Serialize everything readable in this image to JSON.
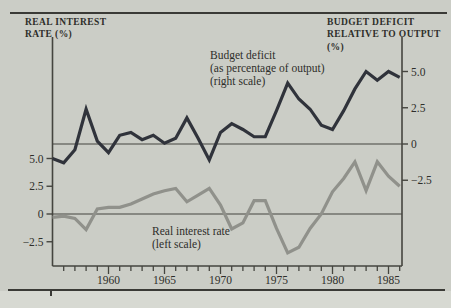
{
  "chart_data": {
    "type": "line",
    "title": "",
    "x": [
      1955,
      1956,
      1957,
      1958,
      1959,
      1960,
      1961,
      1962,
      1963,
      1964,
      1965,
      1966,
      1967,
      1968,
      1969,
      1970,
      1971,
      1972,
      1973,
      1974,
      1975,
      1976,
      1977,
      1978,
      1979,
      1980,
      1981,
      1982,
      1983,
      1984,
      1985,
      1986
    ],
    "series": [
      {
        "name": "Budget deficit (as percentage of output)",
        "scale": "right",
        "color": "#30333b",
        "values": [
          -1.0,
          -1.3,
          -0.4,
          2.4,
          0.2,
          -0.6,
          0.6,
          0.8,
          0.3,
          0.6,
          0.05,
          0.4,
          1.8,
          0.4,
          -1.1,
          0.8,
          1.4,
          1.0,
          0.5,
          0.5,
          2.3,
          4.2,
          3.1,
          2.4,
          1.3,
          1.0,
          2.3,
          3.8,
          5.0,
          4.4,
          5.0,
          4.6
        ]
      },
      {
        "name": "Real interest rate",
        "scale": "left",
        "color": "#90918b",
        "values": [
          -0.3,
          -0.2,
          -0.4,
          -1.4,
          0.45,
          0.6,
          0.6,
          0.9,
          1.35,
          1.8,
          2.1,
          2.3,
          1.1,
          1.7,
          2.3,
          0.8,
          -1.35,
          -0.8,
          1.2,
          1.2,
          -1.3,
          -3.5,
          -3.0,
          -1.3,
          0.0,
          2.0,
          3.2,
          4.7,
          2.1,
          4.7,
          3.4,
          2.5
        ]
      }
    ],
    "left_axis": {
      "header": "REAL INTEREST\nRATE (%)",
      "ticks": [
        5.0,
        2.5,
        0,
        -2.5
      ],
      "tick_labels": [
        "5.0",
        "2.5",
        "0",
        "−2.5"
      ]
    },
    "right_axis": {
      "header": "BUDGET DEFICIT\nRELATIVE TO OUTPUT (%)",
      "ticks": [
        5.0,
        2.5,
        0,
        -2.5
      ],
      "tick_labels": [
        "5.0",
        "2.5",
        "0",
        "−2.5"
      ]
    },
    "x_axis": {
      "major_ticks": [
        1960,
        1965,
        1970,
        1975,
        1980,
        1985
      ],
      "major_tick_labels": [
        "1960",
        "1965",
        "1970",
        "1975",
        "1980",
        "1985"
      ],
      "minor_tick_every_year": true,
      "range": [
        1955,
        1986
      ]
    },
    "annotations": [
      {
        "text": "Budget deficit\n(as percentage of output)\n(right scale)"
      },
      {
        "text": "Real interest rate\n(left scale)"
      }
    ],
    "grid": "zero-lines-only",
    "legend_position": "inline-annotations"
  }
}
